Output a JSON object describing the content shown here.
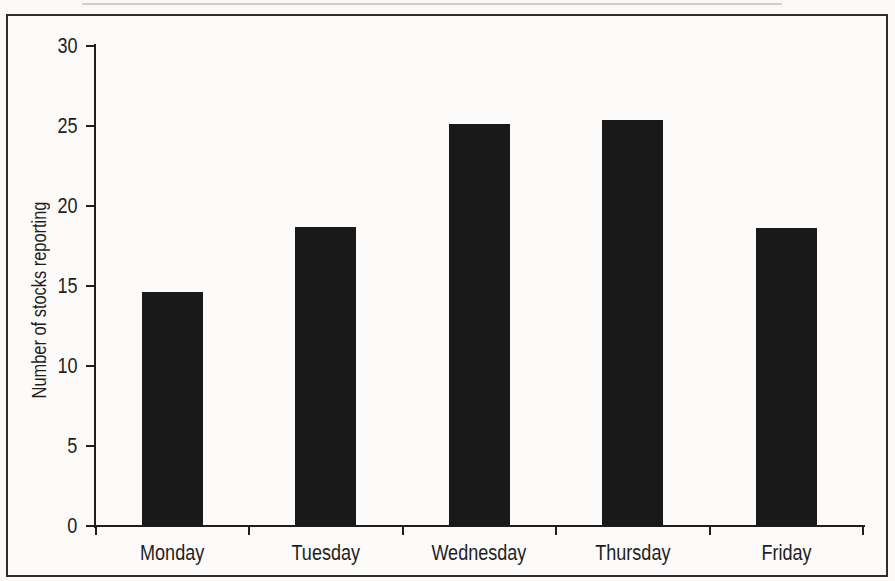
{
  "page": {
    "background_color": "#faf9f6",
    "frame_color": "#2e2d2b",
    "ink_color": "#1f1e1c"
  },
  "chart_data": {
    "type": "bar",
    "title": "",
    "categories": [
      "Monday",
      "Tuesday",
      "Wednesday",
      "Thursday",
      "Friday"
    ],
    "values": [
      14.6,
      18.7,
      25.1,
      25.4,
      18.6
    ],
    "xlabel": "",
    "ylabel": "Number of stocks reporting",
    "ylim": [
      0,
      30
    ],
    "yticks": [
      0,
      5,
      10,
      15,
      20,
      25,
      30
    ],
    "grid": false,
    "legend": null,
    "bar_color": "#191919"
  }
}
